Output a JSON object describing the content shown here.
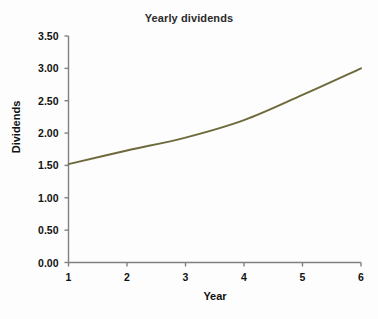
{
  "chart_data": {
    "type": "line",
    "title": "Yearly dividends",
    "xlabel": "Year",
    "ylabel": "Dividends",
    "x": [
      1,
      2,
      3,
      4,
      5,
      6
    ],
    "values": [
      1.52,
      1.73,
      1.93,
      2.2,
      2.59,
      3.0
    ],
    "series": [
      {
        "name": "Dividends",
        "values": [
          1.52,
          1.73,
          1.93,
          2.2,
          2.59,
          3.0
        ]
      }
    ],
    "xlim": [
      1,
      6
    ],
    "ylim": [
      0.0,
      3.5
    ],
    "x_tick_labels": [
      "1",
      "2",
      "3",
      "4",
      "5",
      "6"
    ],
    "y_tick_labels": [
      "0.00",
      "0.50",
      "1.00",
      "1.50",
      "2.00",
      "2.50",
      "3.00",
      "3.50"
    ],
    "y_ticks": [
      0.0,
      0.5,
      1.0,
      1.5,
      2.0,
      2.5,
      3.0,
      3.5
    ],
    "grid": false,
    "legend": false,
    "legend_position": "none",
    "line_color": "#6e6a3c",
    "axis_color": "#808080",
    "text_color": "#111111",
    "title_color": "#2b2b2b",
    "background_color": "#fdfdfd"
  }
}
